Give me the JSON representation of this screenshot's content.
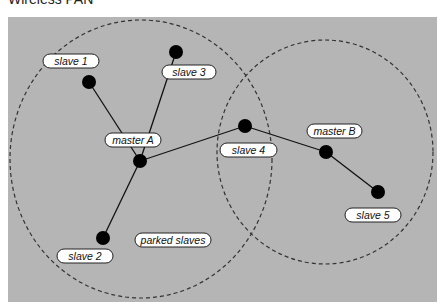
{
  "title": "Wireless PAN",
  "colors": {
    "panel": "#b5b5b5",
    "node": "#000000",
    "label_fill": "#ffffff",
    "dashed_circle": "#333333"
  },
  "piconets": [
    {
      "name": "piconet-A",
      "cx": 141,
      "cy": 159,
      "rx": 131,
      "ry": 139
    },
    {
      "name": "piconet-B",
      "cx": 325,
      "cy": 152,
      "rx": 108,
      "ry": 112
    }
  ],
  "nodes": [
    {
      "id": "slave1",
      "label": "slave 1",
      "x": 89,
      "y": 82,
      "lx": 43,
      "ly": 54,
      "lw": 56
    },
    {
      "id": "slave3",
      "label": "slave 3",
      "x": 176,
      "y": 52,
      "lx": 162,
      "ly": 65,
      "lw": 54
    },
    {
      "id": "masterA",
      "label": "master A",
      "x": 140,
      "y": 161,
      "lx": 105,
      "ly": 133,
      "lw": 56
    },
    {
      "id": "slave4",
      "label": "slave 4",
      "x": 245,
      "y": 126,
      "lx": 220,
      "ly": 143,
      "lw": 57
    },
    {
      "id": "masterB",
      "label": "master B",
      "x": 326,
      "y": 152,
      "lx": 307,
      "ly": 124,
      "lw": 55
    },
    {
      "id": "slave5",
      "label": "slave 5",
      "x": 378,
      "y": 192,
      "lx": 345,
      "ly": 208,
      "lw": 56
    },
    {
      "id": "slave2",
      "label": "slave 2",
      "x": 103,
      "y": 238,
      "lx": 57,
      "ly": 249,
      "lw": 56
    }
  ],
  "edges": [
    [
      "masterA",
      "slave1"
    ],
    [
      "masterA",
      "slave3"
    ],
    [
      "masterA",
      "slave2"
    ],
    [
      "masterA",
      "slave4"
    ],
    [
      "slave4",
      "masterB"
    ],
    [
      "masterB",
      "slave5"
    ]
  ],
  "free_labels": [
    {
      "id": "parked",
      "label": "parked slaves",
      "lx": 135,
      "ly": 233,
      "lw": 76
    }
  ]
}
